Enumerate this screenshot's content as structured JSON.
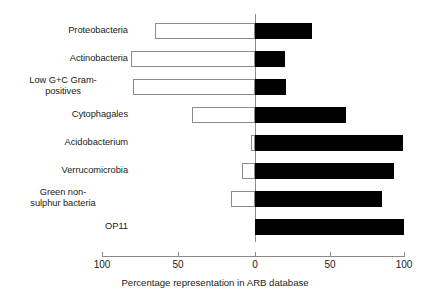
{
  "chart_data": {
    "type": "bar",
    "orientation": "horizontal",
    "title": "",
    "subtitle": "",
    "xlabel": "Percentage representation in ARB database",
    "ylabel": "",
    "xlim": [
      -100,
      100
    ],
    "xticks": [
      -100,
      -50,
      0,
      50,
      100
    ],
    "xticklabels": [
      "100",
      "50",
      "0",
      "50",
      "100"
    ],
    "grid": false,
    "legend": null,
    "note": "Diverging bar chart. Open (white) bars extend left of zero; filled (black) bars extend right of zero.",
    "categories": [
      "Proteobacteria",
      "Actinobacteria",
      "Low G+C Gram-positives",
      "Cytophagales",
      "Acidobacterium",
      "Verrucomicrobia",
      "Green non-sulphur bacteria",
      "OP11"
    ],
    "category_lines": [
      [
        "Proteobacteria"
      ],
      [
        "Actinobacteria"
      ],
      [
        "Low G+C Gram-",
        "positives"
      ],
      [
        "Cytophagales"
      ],
      [
        "Acidobacterium"
      ],
      [
        "Verrucomicrobia"
      ],
      [
        "Green non-",
        "sulphur bacteria"
      ],
      [
        "OP11"
      ]
    ],
    "series": [
      {
        "name": "open-bar-left",
        "color": "#ffffff",
        "edge_color": "#8c8c8c",
        "values": [
          67,
          83,
          82,
          42,
          3,
          9,
          16,
          0
        ]
      },
      {
        "name": "filled-bar-right",
        "color": "#000000",
        "edge_color": "#000000",
        "values": [
          38,
          20,
          21,
          61,
          99,
          93,
          85,
          100
        ]
      }
    ]
  },
  "axis": {
    "title": "Percentage representation in ARB database",
    "tick_labels": [
      "100",
      "50",
      "0",
      "50",
      "100"
    ]
  },
  "colors": {
    "filled_bar": "#000000",
    "open_bar_fill": "#ffffff",
    "open_bar_edge": "#8c8c8c",
    "axis": "#8a8a8a",
    "text": "#1a1a1a",
    "background": "#ffffff"
  }
}
